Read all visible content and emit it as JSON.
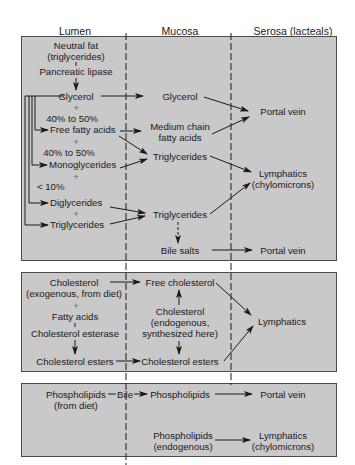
{
  "headers": {
    "lumen": "Lumen",
    "mucosa": "Mucosa",
    "serosa": "Serosa (lacteals)"
  },
  "fat_panel": {
    "lumen": {
      "neutral_fat_1": "Neutral fat",
      "neutral_fat_2": "(triglycerides)",
      "pancreatic_lipase": "Pancreatic lipase",
      "glycerol": "Glycerol",
      "plus1": "+",
      "pct1": "40% to 50%",
      "free_fatty_acids": "Free fatty acids",
      "plus2": "+",
      "pct2": "40% to 50%",
      "monoglycerides": "Monoglycerides",
      "plus3": "+",
      "pct3": "< 10%",
      "diglycerides": "Diglycerides",
      "plus4": "+",
      "triglycerides": "Triglycerides"
    },
    "mucosa": {
      "glycerol": "Glycerol",
      "medium_chain_1": "Medium chain",
      "medium_chain_2": "fatty acids",
      "triglycerides_1": "Triglycerides",
      "triglycerides_2": "Triglycerides",
      "bile_salts": "Bile salts"
    },
    "serosa": {
      "portal_vein_1": "Portal vein",
      "lymphatics_1": "Lymphatics",
      "chylomicrons_1": "(chylomicrons)",
      "portal_vein_2": "Portal vein"
    }
  },
  "cholesterol_panel": {
    "lumen": {
      "cholesterol": "Cholesterol",
      "exogenous": "(exogenous, from diet)",
      "plus": "+",
      "fatty_acids": "Fatty acids",
      "esterase": "Cholesterol esterase",
      "esters": "Cholesterol esters"
    },
    "mucosa": {
      "free_cholesterol": "Free cholesterol",
      "cholesterol": "Cholesterol",
      "endogenous": "(endogenous,",
      "synthesized": "synthesized here)",
      "esters": "Cholesterol esters"
    },
    "serosa": {
      "lymphatics": "Lymphatics"
    }
  },
  "phospholipid_panel": {
    "lumen": {
      "phospholipids": "Phospholipids",
      "bile": "Bile",
      "from_diet": "(from diet)"
    },
    "mucosa": {
      "phospholipids_1": "Phospholipids",
      "phospholipids_2": "Phospholipids",
      "endogenous": "(endogenous)"
    },
    "serosa": {
      "portal_vein": "Portal vein",
      "lymphatics": "Lymphatics",
      "chylomicrons": "(chylomicrons)"
    }
  },
  "colors": {
    "panel_fill": "#c9c9c9",
    "border": "#4a4a4a",
    "ink": "#1a1a1a"
  }
}
